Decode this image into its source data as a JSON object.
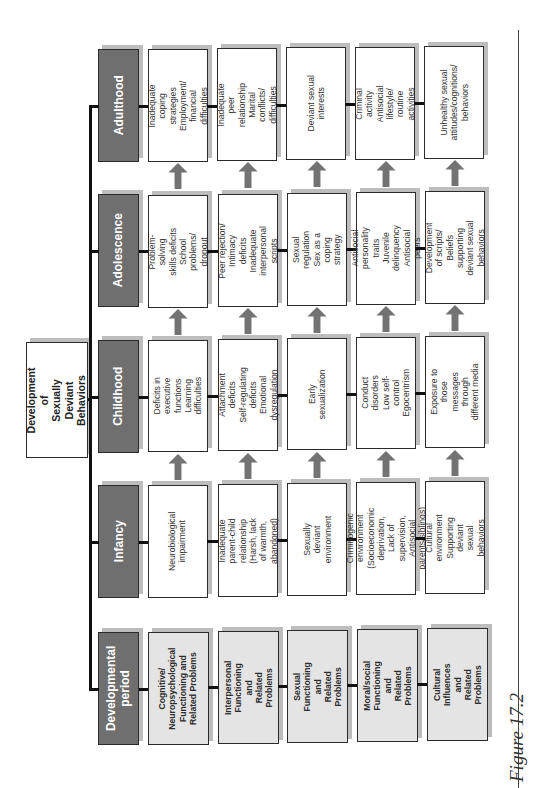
{
  "root": {
    "label": "Development of\nSexually Deviant\nBehaviors"
  },
  "stages": [
    {
      "label": "Adulthood",
      "cells": [
        "Inadequate\ncoping strategies\nEmployment/\nfinancial difficulties",
        "Inadequate peer\nrelationship\nMarital conflicts/\ndifficulties",
        "Deviant sexual\ninterests",
        "Criminal activity\nAntisocial lifestyle/\nroutine activities",
        "Unhealthy sexual\nattitudes/cognitions/\nbehaviors"
      ]
    },
    {
      "label": "Adolescence",
      "cells": [
        "Problem-solving\nskills deficits\nSchool problems/\ndropout",
        "Peer rejection/\nIntimacy deficits\nInadequate\ninterpersonal scripts",
        "Sexual regulation\nSex as a coping strategy",
        "Antisocial personality traits\nJuvenile delinquency\nAntisocial peers",
        "Development of scripts/\nBeliefs supporting\ndeviant sexual behaviors"
      ]
    },
    {
      "label": "Childhood",
      "cells": [
        "Deficits in\nexecutive functions\nLearning difficulties",
        "Attachment deficits\nSelf-regulating deficits\nEmotional dysregulation",
        "Early sexualization",
        "Conduct disorders\nLow self-control\nEgocentrism",
        "Exposure to those\nmessages through\ndifferent media"
      ]
    },
    {
      "label": "Infancy",
      "cells": [
        "Neurobiological\nimpairment",
        "Inadequate parent-child\nrelationship (Harsh, lack\nof warmth, abandoned)",
        "Sexually deviant\nenvironment",
        "Criminogenic environment\n(Socioeconomic deprivation,\nLack of supervision,\nAntisocial parents/siblings)",
        "Cultural environment\nSupporting deviant\nsexual behaviors"
      ]
    },
    {
      "label": "Developmental\nperiod",
      "cells": [
        "Cognitive/\nNeuropsychological\nFunctioning and\nRelated Problems",
        "Interpersonal\nFunctioning and\nRelated Problems",
        "Sexual\nFunctioning and\nRelated Problems",
        "Moral/social\nFunctioning and\nRelated Problems",
        "Cultural\nInfluences and\nRelated Problems"
      ]
    }
  ],
  "caption": "Figure 17.2",
  "colors": {
    "header_fill": "#6f6f6f",
    "domain_fill": "#e4e4e4",
    "cell_fill": "#ffffff",
    "arrow_fill": "#737373",
    "shadow": "#bdbdbd"
  }
}
